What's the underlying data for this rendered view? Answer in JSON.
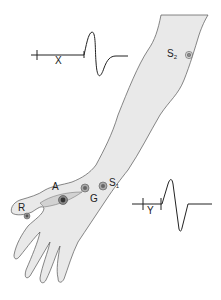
{
  "diagram": {
    "type": "nerve-conduction-study-illustration",
    "colors": {
      "skin_fill": "#e9e9e9",
      "outline": "#555555",
      "trace": "#222222",
      "electrode_outer": "#9a9a9a",
      "electrode_inner": "#444444"
    },
    "labels": {
      "s2": {
        "main": "S",
        "sub": "2"
      },
      "s1": {
        "main": "S",
        "sub": "1"
      },
      "a": "A",
      "g": "G",
      "r": "R",
      "x": "X",
      "y": "Y"
    },
    "electrodes": [
      {
        "id": "S2",
        "role": "proximal-stimulation-site",
        "x": 189,
        "y": 55
      },
      {
        "id": "S1",
        "role": "distal-stimulation-site",
        "x": 102,
        "y": 186
      },
      {
        "id": "G",
        "role": "ground-electrode",
        "x": 84,
        "y": 188
      },
      {
        "id": "A",
        "role": "active-recording-electrode",
        "x": 63,
        "y": 200
      },
      {
        "id": "R",
        "role": "reference-electrode",
        "x": 27,
        "y": 216
      }
    ],
    "traces": [
      {
        "id": "proximal-response",
        "latency_label": "X",
        "position": "top-left"
      },
      {
        "id": "distal-response",
        "latency_label": "Y",
        "position": "bottom-right"
      }
    ]
  }
}
